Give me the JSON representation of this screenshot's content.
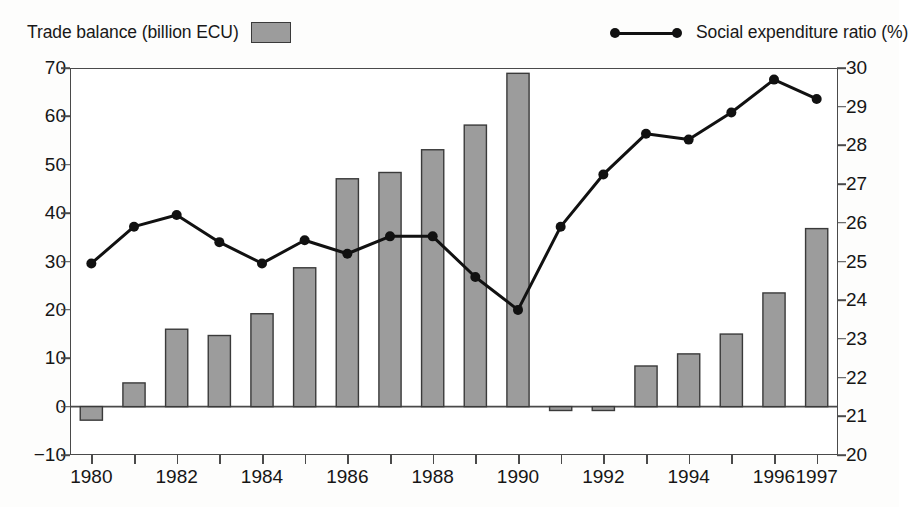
{
  "legend": {
    "bar_label": "Trade balance (billion ECU)",
    "line_label": "Social expenditure ratio (%)",
    "bar_swatch_icon": "filled-rectangle-swatch",
    "line_swatch_icon": "line-with-dots-marker"
  },
  "colors": {
    "bar_fill": "#9c9c9c",
    "bar_stroke": "#3a3a3a",
    "line_stroke": "#111111",
    "marker_fill": "#111111",
    "axis": "#4a4a4a",
    "background": "#ffffff"
  },
  "chart_data": {
    "type": "bar",
    "title": "",
    "subtitle": "",
    "xlabel": "",
    "ylabel": "",
    "grid": false,
    "legend_position": "top",
    "categories": [
      "1980",
      "1981",
      "1982",
      "1983",
      "1984",
      "1985",
      "1986",
      "1987",
      "1988",
      "1989",
      "1990",
      "1991",
      "1992",
      "1993",
      "1994",
      "1995",
      "1996",
      "1997"
    ],
    "x_tick_labels": [
      "1980",
      "",
      "1982",
      "",
      "1984",
      "",
      "1986",
      "",
      "1988",
      "",
      "1990",
      "",
      "1992",
      "",
      "1994",
      "",
      "1996",
      "1997"
    ],
    "y_left": {
      "label": "Trade balance (billion ECU)",
      "ticks": [
        -10,
        0,
        10,
        20,
        30,
        40,
        50,
        60,
        70
      ],
      "tick_labels": [
        "−10",
        "0",
        "10",
        "20",
        "30",
        "40",
        "50",
        "60",
        "70"
      ],
      "ylim": [
        -10,
        70
      ]
    },
    "y_right": {
      "label": "Social expenditure ratio (%)",
      "ticks": [
        20,
        21,
        22,
        23,
        24,
        25,
        26,
        27,
        28,
        29,
        30
      ],
      "tick_labels": [
        "20",
        "21",
        "22",
        "23",
        "24",
        "25",
        "26",
        "27",
        "28",
        "29",
        "30"
      ],
      "ylim": [
        20,
        30
      ]
    },
    "series": [
      {
        "name": "Trade balance (billion ECU)",
        "type": "bar",
        "axis": "left",
        "values": [
          -2.8,
          4.9,
          16.0,
          14.7,
          19.2,
          28.7,
          47.1,
          48.4,
          53.1,
          58.2,
          68.9,
          -0.8,
          -0.8,
          8.4,
          10.9,
          15.0,
          23.5,
          36.8
        ]
      },
      {
        "name": "Social expenditure ratio (%)",
        "type": "line",
        "axis": "right",
        "values": [
          24.95,
          25.9,
          26.2,
          25.5,
          24.95,
          25.55,
          25.2,
          25.65,
          25.65,
          24.6,
          23.75,
          25.9,
          27.25,
          28.3,
          28.15,
          28.85,
          29.7,
          29.2
        ]
      }
    ]
  }
}
